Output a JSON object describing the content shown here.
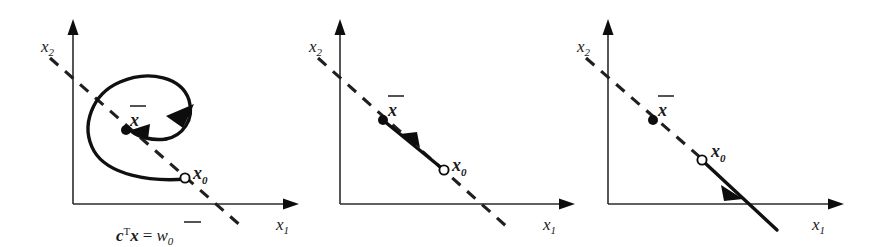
{
  "figure": {
    "background_color": "#ffffff",
    "ink_color": "#101010",
    "panel_count": 3
  },
  "labels": {
    "x2_axis": "x",
    "x2_axis_sub": "2",
    "x1_axis": "x",
    "x1_axis_sub": "1",
    "xbar": "x",
    "x0": "x",
    "x0_sub": "0",
    "equation_c": "c",
    "equation_transpose": "T",
    "equation_x": "x",
    "equation_equals": "=",
    "equation_w": "w",
    "equation_w_sub": "0"
  },
  "panels": [
    {
      "id": "panel-spiral",
      "name": "spiral-convergence-panel",
      "origin": {
        "x": 73,
        "y": 204
      },
      "x_axis_tip": {
        "x": 297,
        "y": 204
      },
      "y_axis_tip": {
        "x": 73,
        "y": 22
      },
      "x2_label_pos": {
        "x": 42,
        "y": 46
      },
      "x1_label_pos": {
        "x": 277,
        "y": 224
      },
      "hyperplane": {
        "from": {
          "x": 50,
          "y": 58
        },
        "to": {
          "x": 241,
          "y": 226
        }
      },
      "xbar_point": {
        "x": 126,
        "y": 130
      },
      "xbar_label_pos": {
        "x": 131,
        "y": 122
      },
      "x0_point": {
        "x": 185,
        "y": 178
      },
      "x0_label_pos": {
        "x": 194,
        "y": 180
      },
      "equation_label_pos": {
        "x": 118,
        "y": 238
      },
      "trajectory_type": "inward-spiral",
      "arrow_count": 2
    },
    {
      "id": "panel-segment-inward",
      "name": "straight-inward-panel",
      "origin": {
        "x": 340,
        "y": 204
      },
      "x_axis_tip": {
        "x": 573,
        "y": 204
      },
      "y_axis_tip": {
        "x": 340,
        "y": 22
      },
      "x2_label_pos": {
        "x": 310,
        "y": 46
      },
      "x1_label_pos": {
        "x": 544,
        "y": 224
      },
      "hyperplane": {
        "from": {
          "x": 318,
          "y": 58
        },
        "to": {
          "x": 506,
          "y": 226
        }
      },
      "xbar_point": {
        "x": 383,
        "y": 120
      },
      "xbar_label_pos": {
        "x": 389,
        "y": 112
      },
      "x0_point": {
        "x": 444,
        "y": 170
      },
      "x0_label_pos": {
        "x": 453,
        "y": 172
      },
      "trajectory_type": "segment-toward-xbar",
      "arrow_count": 1
    },
    {
      "id": "panel-ray-outward",
      "name": "straight-outward-panel",
      "origin": {
        "x": 608,
        "y": 204
      },
      "x_axis_tip": {
        "x": 842,
        "y": 204
      },
      "y_axis_tip": {
        "x": 608,
        "y": 22
      },
      "x2_label_pos": {
        "x": 578,
        "y": 46
      },
      "x1_label_pos": {
        "x": 813,
        "y": 224
      },
      "hyperplane": {
        "from": {
          "x": 586,
          "y": 58
        },
        "to": {
          "x": 700,
          "y": 159
        }
      },
      "xbar_point": {
        "x": 653,
        "y": 120
      },
      "xbar_label_pos": {
        "x": 659,
        "y": 112
      },
      "x0_point": {
        "x": 702,
        "y": 160
      },
      "x0_label_pos": {
        "x": 712,
        "y": 158
      },
      "ray": {
        "from": {
          "x": 704,
          "y": 162
        },
        "to": {
          "x": 776,
          "y": 229
        }
      },
      "trajectory_type": "ray-away-from-xbar",
      "arrow_count": 1
    }
  ]
}
